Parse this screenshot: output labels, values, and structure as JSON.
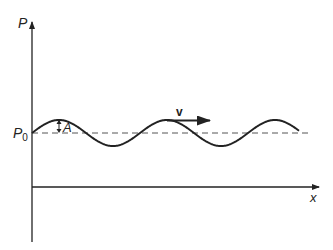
{
  "diagram": {
    "labels": {
      "y_axis": "P",
      "x_axis": "x",
      "baseline": "P",
      "baseline_subscript": "0",
      "amplitude": "A",
      "velocity": "v"
    },
    "colors": {
      "line": "#222222",
      "dashed": "#555555",
      "background": "#ffffff"
    },
    "wave": {
      "type": "sinusoid",
      "baseline_y": 133,
      "amplitude_px": 13,
      "period_px": 108,
      "start_x": 32,
      "end_x": 299,
      "cycles": 2.5
    }
  }
}
